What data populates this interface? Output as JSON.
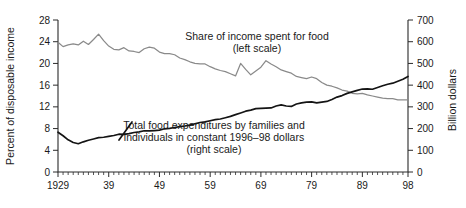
{
  "chart_data": {
    "type": "line",
    "title": "",
    "xlabel": "",
    "ylabel": "Percent of disposable income",
    "y2label": "Billion dollars",
    "grid": false,
    "legend": "annotations",
    "xlim": [
      1929,
      1998
    ],
    "ylim": [
      0,
      28
    ],
    "y2lim": [
      0,
      700
    ],
    "x_tick_labels": [
      "1929",
      "39",
      "49",
      "59",
      "69",
      "79",
      "89",
      "98"
    ],
    "x_tick_values": [
      1929,
      1939,
      1949,
      1959,
      1969,
      1979,
      1989,
      1998
    ],
    "x_minor_tick_step": 1,
    "y_tick_labels": [
      "0",
      "4",
      "8",
      "12",
      "16",
      "20",
      "24",
      "28"
    ],
    "y_tick_values": [
      0,
      4,
      8,
      12,
      16,
      20,
      24,
      28
    ],
    "y2_tick_labels": [
      "0",
      "100",
      "200",
      "300",
      "400",
      "500",
      "600",
      "700"
    ],
    "y2_tick_values": [
      0,
      100,
      200,
      300,
      400,
      500,
      600,
      700
    ],
    "annotations": [
      {
        "id": "share-annotation",
        "lines": [
          "Share of income spent for food",
          "(left scale)"
        ],
        "x_px": 257,
        "y_px": 40,
        "anchor": "middle",
        "series": "share_of_income"
      },
      {
        "id": "expenditures-annotation",
        "lines": [
          "Total food expenditures by families and",
          "individuals in constant 1996–98 dollars",
          "(right scale)"
        ],
        "x_px": 214,
        "y_px": 129,
        "anchor": "middle",
        "series": "total_expenditures"
      }
    ],
    "colors": {
      "share_of_income": "#8a8a8a",
      "total_expenditures": "#141414",
      "axis": "#2b2b2b",
      "text": "#1a1a1a",
      "background": "#ffffff"
    },
    "x": [
      1929,
      1930,
      1931,
      1932,
      1933,
      1934,
      1935,
      1936,
      1937,
      1938,
      1939,
      1940,
      1941,
      1942,
      1943,
      1944,
      1945,
      1946,
      1947,
      1948,
      1949,
      1950,
      1951,
      1952,
      1953,
      1954,
      1955,
      1956,
      1957,
      1958,
      1959,
      1960,
      1961,
      1962,
      1963,
      1964,
      1965,
      1966,
      1967,
      1968,
      1969,
      1970,
      1971,
      1972,
      1973,
      1974,
      1975,
      1976,
      1977,
      1978,
      1979,
      1980,
      1981,
      1982,
      1983,
      1984,
      1985,
      1986,
      1987,
      1988,
      1989,
      1990,
      1991,
      1992,
      1993,
      1994,
      1995,
      1996,
      1997,
      1998
    ],
    "series": [
      {
        "name": "Share of income spent for food",
        "axis": "left",
        "unit": "percent of disposable income",
        "color": "#8a8a8a",
        "values": [
          23.9,
          23.1,
          23.4,
          23.6,
          23.4,
          24.1,
          23.5,
          24.4,
          25.4,
          24.2,
          23.2,
          22.6,
          22.5,
          22.9,
          22.3,
          22.2,
          22.0,
          22.7,
          23.0,
          22.8,
          22.1,
          21.8,
          21.8,
          21.6,
          21.0,
          20.7,
          20.3,
          20.0,
          19.9,
          19.9,
          19.4,
          19.0,
          18.7,
          18.5,
          18.1,
          17.7,
          20.0,
          18.9,
          17.9,
          18.6,
          19.3,
          20.5,
          19.9,
          19.4,
          18.8,
          18.5,
          18.2,
          17.6,
          17.4,
          17.2,
          17.5,
          17.2,
          16.5,
          16.0,
          15.8,
          15.5,
          15.1,
          14.9,
          14.5,
          14.4,
          14.5,
          14.2,
          14.0,
          13.8,
          13.6,
          13.5,
          13.5,
          13.3,
          13.3,
          13.3
        ]
      },
      {
        "name": "Total food expenditures by families and individuals in constant 1996–98 dollars",
        "axis": "right",
        "unit": "billion dollars",
        "color": "#141414",
        "values": [
          183,
          167,
          148,
          136,
          130,
          139,
          146,
          152,
          158,
          160,
          164,
          168,
          174,
          173,
          177,
          182,
          185,
          190,
          189,
          191,
          193,
          199,
          201,
          205,
          209,
          212,
          216,
          222,
          228,
          231,
          236,
          241,
          244,
          250,
          256,
          264,
          272,
          280,
          285,
          292,
          293,
          294,
          295,
          304,
          309,
          304,
          302,
          313,
          318,
          322,
          323,
          318,
          322,
          325,
          334,
          345,
          352,
          362,
          369,
          376,
          382,
          383,
          381,
          389,
          397,
          404,
          409,
          418,
          427,
          440
        ]
      }
    ]
  },
  "geometry": {
    "plot_left_px": 58,
    "plot_right_px": 408,
    "plot_top_px": 20,
    "plot_bottom_px": 172
  }
}
